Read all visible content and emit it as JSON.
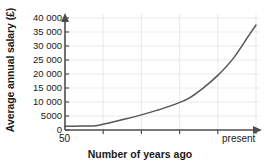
{
  "chart_data": {
    "type": "line",
    "title": "",
    "xlabel": "Number of years ago",
    "ylabel": "Average annual salary (£)",
    "ylim": [
      0,
      40000
    ],
    "ytick_values": [
      0,
      5000,
      10000,
      15000,
      20000,
      25000,
      30000,
      35000,
      40000
    ],
    "ytick_labels": [
      "0",
      "5000",
      "10 000",
      "15 000",
      "20 000",
      "25 000",
      "30 000",
      "35 000",
      "40 000"
    ],
    "xlim": [
      50,
      0
    ],
    "x_axis_direction": "years ago decreasing left to right",
    "xtick_labels": [
      "50",
      "present"
    ],
    "x_first_label": "50",
    "x_last_label": "present",
    "xtick_positions_years_ago": [
      50,
      40,
      30,
      20,
      10,
      0
    ],
    "grid": true,
    "legend": false,
    "series": [
      {
        "name": "Average annual salary",
        "x_years_ago": [
          50,
          46,
          42,
          38,
          34,
          30,
          26,
          22,
          18,
          14,
          10,
          6,
          2,
          0
        ],
        "values": [
          1300,
          1400,
          1500,
          2700,
          4000,
          5400,
          7000,
          8800,
          11000,
          14800,
          19500,
          25500,
          33500,
          37500
        ]
      }
    ],
    "annotations": [
      "Curve is nearly flat at about 1500 between 50 and 42 years ago",
      "Growth accelerates steadily, reaching about 15 000 at 18 years ago",
      "Curve ends at about 37 500 at present"
    ],
    "colors": {
      "line": "#565656",
      "axis": "#4d4d4d",
      "grid": "#e9e9e9",
      "text": "#1a1a1a",
      "background": "#ffffff"
    }
  }
}
